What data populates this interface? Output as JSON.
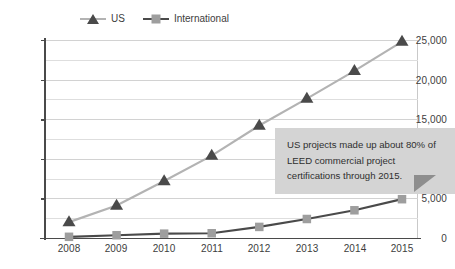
{
  "legend": {
    "position": "top-center",
    "items": [
      {
        "label": "US",
        "marker": "triangle-marker",
        "marker_color": "#4a4a4a",
        "line_color": "#b3b3b3"
      },
      {
        "label": "International",
        "marker": "square-marker",
        "marker_color": "#9e9e9e",
        "line_color": "#4a4a4a"
      }
    ]
  },
  "annotation": {
    "text": "US projects made up about 80% of LEED commercial project certifications through 2015.",
    "background": "#d4d4d4",
    "tail_color": "#8e8e8e"
  },
  "axis": {
    "y_ticks": [
      "0",
      "5,000",
      "10,000",
      "15,000",
      "20,000",
      "25,000"
    ],
    "x_ticks": [
      "2008",
      "2009",
      "2010",
      "2011",
      "2012",
      "2013",
      "2014",
      "2015"
    ]
  },
  "chart_data": {
    "type": "line",
    "title": "",
    "subtitle": "",
    "xlabel": "",
    "ylabel": "",
    "x": [
      2008,
      2009,
      2010,
      2011,
      2012,
      2013,
      2014,
      2015
    ],
    "categories": [
      "2008",
      "2009",
      "2010",
      "2011",
      "2012",
      "2013",
      "2014",
      "2015"
    ],
    "series": [
      {
        "name": "US",
        "values": [
          2000,
          4100,
          7200,
          10400,
          14200,
          17600,
          21100,
          24800
        ],
        "line_color": "#b3b3b3",
        "marker": "triangle",
        "marker_color": "#4a4a4a"
      },
      {
        "name": "International",
        "values": [
          150,
          350,
          550,
          600,
          1400,
          2400,
          3500,
          4900
        ],
        "line_color": "#4a4a4a",
        "marker": "square",
        "marker_color": "#9e9e9e"
      }
    ],
    "ylim": [
      0,
      25000
    ],
    "ytick_values": [
      0,
      5000,
      10000,
      15000,
      20000,
      25000
    ],
    "minor_gridline_values": [
      2500,
      7500,
      12500,
      17500,
      22500
    ],
    "grid": true,
    "legend_position": "top-center",
    "annotations": [
      {
        "text": "US projects made up about 80% of LEED commercial project certifications through 2015."
      }
    ]
  }
}
